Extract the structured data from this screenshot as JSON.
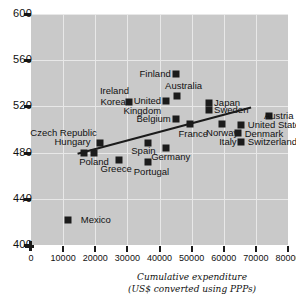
{
  "chart_data": {
    "type": "scatter",
    "title": "",
    "xlabel": "Cumulative expenditure",
    "xlabel_sub": "(US$ converted using PPPs)",
    "ylabel": "",
    "xlim": [
      0,
      80000
    ],
    "ylim": [
      400,
      600
    ],
    "xticks": [
      0,
      10000,
      20000,
      30000,
      40000,
      50000,
      60000,
      70000,
      80000
    ],
    "xtick_labels": [
      "0",
      "10000",
      "20000",
      "30000",
      "40000",
      "50000",
      "60000",
      "70000",
      "80000"
    ],
    "yticks": [
      400,
      440,
      480,
      520,
      560,
      600
    ],
    "ytick_labels": [
      "400",
      "440",
      "480",
      "520",
      "560",
      "600"
    ],
    "grid": true,
    "legend": "none",
    "trendline": {
      "x0": 14500,
      "y0": 479,
      "x1": 68500,
      "y1": 519
    },
    "points": [
      {
        "label": "Mexico",
        "x": 11500,
        "y": 422,
        "lx": 15500,
        "ly": 422,
        "align": "l"
      },
      {
        "label": "Poland",
        "x": 16500,
        "y": 480,
        "lx": 15000,
        "ly": 472,
        "align": "l"
      },
      {
        "label": "Hungary",
        "x": 19500,
        "y": 480,
        "lx": 18500,
        "ly": 489,
        "align": "r"
      },
      {
        "label": "Czech Republic",
        "x": 21500,
        "y": 488,
        "lx": 20500,
        "ly": 497,
        "align": "r"
      },
      {
        "label": "Greece",
        "x": 27500,
        "y": 474,
        "lx": 26500,
        "ly": 466,
        "align": "c"
      },
      {
        "label": "Portugal",
        "x": 36500,
        "y": 472,
        "lx": 37500,
        "ly": 463,
        "align": "c"
      },
      {
        "label": "Spain",
        "x": 36500,
        "y": 488,
        "lx": 35000,
        "ly": 481,
        "align": "c"
      },
      {
        "label": "Korea",
        "x": 30500,
        "y": 524,
        "lx": 29500,
        "ly": 524,
        "align": "r"
      },
      {
        "label": "Ireland",
        "x": 30500,
        "y": 524,
        "lx": 30500,
        "ly": 533,
        "align": "r"
      },
      {
        "label": "United",
        "x": 42000,
        "y": 525,
        "lx": 40500,
        "ly": 525,
        "align": "r"
      },
      {
        "label": "Kingdom",
        "x": 42000,
        "y": 525,
        "lx": 40500,
        "ly": 516,
        "align": "r"
      },
      {
        "label": "Finland",
        "x": 45000,
        "y": 548,
        "lx": 43500,
        "ly": 548,
        "align": "r"
      },
      {
        "label": "Australia",
        "x": 45500,
        "y": 529,
        "lx": 47500,
        "ly": 538,
        "align": "c"
      },
      {
        "label": "Belgium",
        "x": 45000,
        "y": 509,
        "lx": 43500,
        "ly": 509,
        "align": "r"
      },
      {
        "label": "France",
        "x": 49500,
        "y": 505,
        "lx": 50500,
        "ly": 496,
        "align": "c"
      },
      {
        "label": "Germany",
        "x": 42000,
        "y": 484,
        "lx": 43500,
        "ly": 476,
        "align": "c"
      },
      {
        "label": "Japan",
        "x": 55500,
        "y": 523,
        "lx": 57000,
        "ly": 523,
        "align": "l"
      },
      {
        "label": "Sweden",
        "x": 55500,
        "y": 517,
        "lx": 57000,
        "ly": 517,
        "align": "l"
      },
      {
        "label": "Norway",
        "x": 59500,
        "y": 505,
        "lx": 59500,
        "ly": 497,
        "align": "c"
      },
      {
        "label": "Italy",
        "x": 65500,
        "y": 489,
        "lx": 64000,
        "ly": 489,
        "align": "r"
      },
      {
        "label": "Switzerland",
        "x": 65500,
        "y": 489,
        "lx": 67500,
        "ly": 489,
        "align": "l"
      },
      {
        "label": "Denmark",
        "x": 64500,
        "y": 497,
        "lx": 66500,
        "ly": 496,
        "align": "l"
      },
      {
        "label": "United States",
        "x": 65500,
        "y": 504,
        "lx": 67500,
        "ly": 504,
        "align": "l"
      },
      {
        "label": "Austria",
        "x": 74000,
        "y": 512,
        "lx": 72500,
        "ly": 512,
        "align": "l"
      }
    ]
  }
}
